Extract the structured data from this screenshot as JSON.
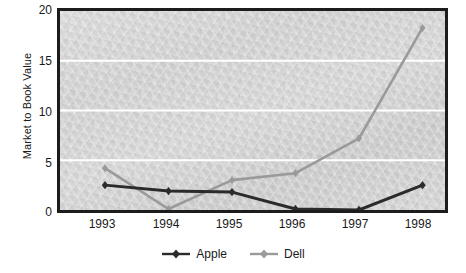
{
  "chart_data": {
    "type": "line",
    "title": "",
    "xlabel": "",
    "ylabel": "Market to Book Value",
    "categories": [
      "1993",
      "1994",
      "1995",
      "1996",
      "1997",
      "1998"
    ],
    "series": [
      {
        "name": "Apple",
        "color": "#2b2b2b",
        "values": [
          2.5,
          1.9,
          1.8,
          0.1,
          0.0,
          2.5
        ]
      },
      {
        "name": "Dell",
        "color": "#9a9a9a",
        "values": [
          4.2,
          0.1,
          3.0,
          3.7,
          7.2,
          18.3
        ]
      }
    ],
    "ylim": [
      0,
      20
    ],
    "yticks": [
      "0",
      "5",
      "10",
      "15",
      "20"
    ],
    "ytick_values": [
      0,
      5,
      10,
      15,
      20
    ],
    "grid": "horizontal-white",
    "legend_position": "bottom-center",
    "marker": "diamond"
  },
  "axes": {
    "y_title": "Market to Book Value",
    "y_tick_labels": [
      "20",
      "15",
      "10",
      "5",
      "0"
    ],
    "x_tick_labels": [
      "1993",
      "1994",
      "1995",
      "1996",
      "1997",
      "1998"
    ]
  },
  "legend": {
    "items": [
      {
        "label": "Apple",
        "color": "#2b2b2b"
      },
      {
        "label": "Dell",
        "color": "#9a9a9a"
      }
    ]
  },
  "colors": {
    "apple": "#2b2b2b",
    "dell": "#9a9a9a",
    "frame": "#1c1c1c",
    "gridline": "#ffffff",
    "plot_background": "#d0d0d0",
    "text": "#1a1a1a"
  }
}
